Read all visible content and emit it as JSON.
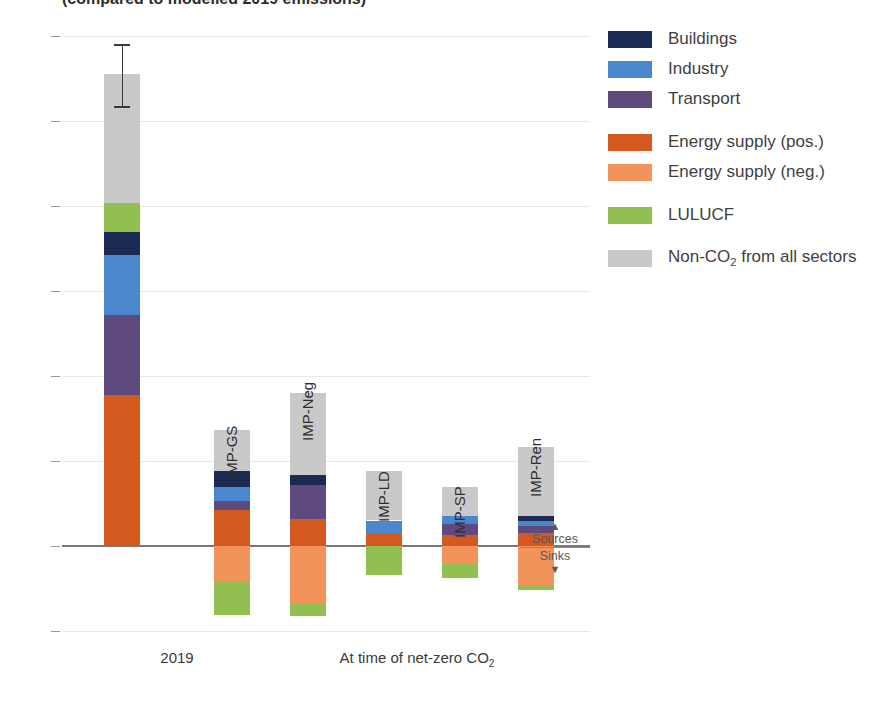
{
  "caption": "(compared to modelled 2019 emissions)",
  "axes": {
    "ylabel_text": "GtCO",
    "ylabel_sub": "2",
    "ylabel_rest": "-eq yr",
    "ylabel_sup": "-1",
    "yticks": [
      60,
      50,
      40,
      30,
      20,
      10,
      0,
      -10
    ],
    "ytick_labels": [
      "60",
      "50",
      "40",
      "30",
      "20",
      "10",
      "0",
      "–10"
    ],
    "ymin": -10,
    "ymax": 60,
    "xcats": [
      {
        "label": "2019",
        "sub": "",
        "left": 60,
        "width": 110
      },
      {
        "label": "At time of net-zero CO",
        "sub": "2",
        "left": 190,
        "width": 330
      }
    ]
  },
  "annotation": {
    "sources": "Sources",
    "sinks": "Sinks",
    "up_arrow": "▲",
    "down_arrow": "▼"
  },
  "colors": {
    "buildings": "#1b2a52",
    "industry": "#4b87cf",
    "transport": "#5e4a7d",
    "energy_pos": "#d4591e",
    "energy_neg": "#f0945c",
    "lulucf": "#92c050",
    "nonco2": "#c9c9c9",
    "grid": "#e8e8e8",
    "zero": "#7a7a7a",
    "text": "#3f3f3f"
  },
  "legend": {
    "position": "right",
    "items": [
      {
        "key": "buildings",
        "label": "Buildings",
        "sub": "",
        "color": "#1b2a52",
        "gap_after": false
      },
      {
        "key": "industry",
        "label": "Industry",
        "sub": "",
        "color": "#4b87cf",
        "gap_after": false
      },
      {
        "key": "transport",
        "label": "Transport",
        "sub": "",
        "color": "#5e4a7d",
        "gap_after": true
      },
      {
        "key": "energy_pos",
        "label": "Energy supply (pos.)",
        "sub": "",
        "color": "#d4591e",
        "gap_after": false
      },
      {
        "key": "energy_neg",
        "label": "Energy supply (neg.)",
        "sub": "",
        "color": "#f0945c",
        "gap_after": true
      },
      {
        "key": "lulucf",
        "label": "LULUCF",
        "sub": "",
        "color": "#92c050",
        "gap_after": true
      },
      {
        "key": "nonco2",
        "label": "Non-CO",
        "sub": "2",
        "label2": " from all sectors",
        "color": "#c9c9c9",
        "gap_after": false
      }
    ]
  },
  "chart_data": {
    "type": "bar",
    "subtype": "stacked-diverging",
    "title": "(compared to modelled 2019 emissions)",
    "xlabel": "",
    "ylabel": "GtCO2-eq yr-1",
    "ylim": [
      -10,
      60
    ],
    "grid": true,
    "legend_position": "right",
    "categories": [
      "2019",
      "IMP-GS",
      "IMP-Neg",
      "IMP-LD",
      "IMP-SP",
      "IMP-Ren"
    ],
    "series": [
      {
        "name": "Energy supply (pos.)",
        "color": "#d4591e",
        "values": [
          17.8,
          4.2,
          3.2,
          1.5,
          1.3,
          1.5
        ]
      },
      {
        "name": "Transport",
        "color": "#5e4a7d",
        "values": [
          7.3,
          1.1,
          4.0,
          0.0,
          1.3,
          0.9
        ]
      },
      {
        "name": "Industry",
        "color": "#4b87cf",
        "values": [
          7.0,
          1.6,
          0.0,
          1.5,
          0.9,
          0.5
        ]
      },
      {
        "name": "Buildings",
        "color": "#1b2a52",
        "values": [
          2.7,
          1.9,
          1.2,
          0.0,
          0.0,
          0.6
        ]
      },
      {
        "name": "LULUCF (pos.)",
        "color": "#92c050",
        "values": [
          3.4,
          0.0,
          0.0,
          0.0,
          0.0,
          0.0
        ]
      },
      {
        "name": "Non-CO2 from all sectors",
        "color": "#c9c9c9",
        "values": [
          15.3,
          4.9,
          9.6,
          5.8,
          3.5,
          8.2
        ]
      },
      {
        "name": "Energy supply (neg.)",
        "color": "#f0945c",
        "values": [
          0,
          -4.2,
          -6.7,
          0.0,
          -2.0,
          -4.6
        ]
      },
      {
        "name": "LULUCF (neg.)",
        "color": "#92c050",
        "values": [
          0,
          -3.9,
          -1.5,
          -3.4,
          -1.8,
          -0.6
        ]
      }
    ],
    "totals_positive": [
      55.0,
      13.7,
      18.0,
      8.8,
      7.0,
      11.7
    ],
    "totals_negative": [
      0,
      -8.1,
      -8.2,
      -3.4,
      -3.8,
      -5.2
    ],
    "error_bar": {
      "category": "2019",
      "value": 55.0,
      "low": 51.8,
      "high": 59.1
    }
  },
  "bars": [
    {
      "name": "2019",
      "label": "",
      "left": 42,
      "width": 36,
      "error": {
        "low": 51.8,
        "high": 59.1
      },
      "pos": [
        {
          "key": "energy_pos",
          "color": "#d4591e",
          "from": 0.0,
          "to": 17.8
        },
        {
          "key": "transport",
          "color": "#5e4a7d",
          "from": 17.8,
          "to": 27.2
        },
        {
          "key": "industry",
          "color": "#4b87cf",
          "from": 27.2,
          "to": 34.2
        },
        {
          "key": "buildings",
          "color": "#1b2a52",
          "from": 34.2,
          "to": 36.9
        },
        {
          "key": "lulucf",
          "color": "#92c050",
          "from": 36.9,
          "to": 40.3
        },
        {
          "key": "nonco2",
          "color": "#c9c9c9",
          "from": 40.3,
          "to": 55.5
        }
      ],
      "neg": []
    },
    {
      "name": "IMP-GS",
      "label": "IMP-GS",
      "left": 152,
      "width": 36,
      "error": null,
      "pos": [
        {
          "key": "energy_pos",
          "color": "#d4591e",
          "from": 0.0,
          "to": 4.2
        },
        {
          "key": "transport",
          "color": "#5e4a7d",
          "from": 4.2,
          "to": 5.3
        },
        {
          "key": "industry",
          "color": "#4b87cf",
          "from": 5.3,
          "to": 6.9
        },
        {
          "key": "buildings",
          "color": "#1b2a52",
          "from": 6.9,
          "to": 8.8
        },
        {
          "key": "nonco2",
          "color": "#c9c9c9",
          "from": 8.8,
          "to": 13.7
        }
      ],
      "neg": [
        {
          "key": "energy_neg",
          "color": "#f0945c",
          "from": 0.0,
          "to": -4.2
        },
        {
          "key": "lulucf",
          "color": "#92c050",
          "from": -4.2,
          "to": -8.1
        }
      ]
    },
    {
      "name": "IMP-Neg",
      "label": "IMP-Neg",
      "left": 228,
      "width": 36,
      "error": null,
      "pos": [
        {
          "key": "energy_pos",
          "color": "#d4591e",
          "from": 0.0,
          "to": 3.2
        },
        {
          "key": "transport",
          "color": "#5e4a7d",
          "from": 3.2,
          "to": 7.2
        },
        {
          "key": "buildings",
          "color": "#1b2a52",
          "from": 7.2,
          "to": 8.4
        },
        {
          "key": "nonco2",
          "color": "#c9c9c9",
          "from": 8.4,
          "to": 18.0
        }
      ],
      "neg": [
        {
          "key": "energy_neg",
          "color": "#f0945c",
          "from": 0.0,
          "to": -6.7
        },
        {
          "key": "lulucf",
          "color": "#92c050",
          "from": -6.7,
          "to": -8.2
        }
      ]
    },
    {
      "name": "IMP-LD",
      "label": "IMP-LD",
      "left": 304,
      "width": 36,
      "error": null,
      "pos": [
        {
          "key": "energy_pos",
          "color": "#d4591e",
          "from": 0.0,
          "to": 1.5
        },
        {
          "key": "industry",
          "color": "#4b87cf",
          "from": 1.5,
          "to": 3.0
        },
        {
          "key": "nonco2",
          "color": "#c9c9c9",
          "from": 3.0,
          "to": 8.8
        }
      ],
      "neg": [
        {
          "key": "lulucf",
          "color": "#92c050",
          "from": 0.0,
          "to": -3.4
        }
      ]
    },
    {
      "name": "IMP-SP",
      "label": "IMP-SP",
      "left": 380,
      "width": 36,
      "error": null,
      "pos": [
        {
          "key": "energy_pos",
          "color": "#d4591e",
          "from": 0.0,
          "to": 1.3
        },
        {
          "key": "transport",
          "color": "#5e4a7d",
          "from": 1.3,
          "to": 2.6
        },
        {
          "key": "industry",
          "color": "#4b87cf",
          "from": 2.6,
          "to": 3.5
        },
        {
          "key": "nonco2",
          "color": "#c9c9c9",
          "from": 3.5,
          "to": 7.0
        }
      ],
      "neg": [
        {
          "key": "energy_neg",
          "color": "#f0945c",
          "from": 0.0,
          "to": -2.0
        },
        {
          "key": "lulucf",
          "color": "#92c050",
          "from": -2.0,
          "to": -3.8
        }
      ]
    },
    {
      "name": "IMP-Ren",
      "label": "IMP-Ren",
      "left": 456,
      "width": 36,
      "error": null,
      "pos": [
        {
          "key": "energy_pos",
          "color": "#d4591e",
          "from": 0.0,
          "to": 1.5
        },
        {
          "key": "transport",
          "color": "#5e4a7d",
          "from": 1.5,
          "to": 2.4
        },
        {
          "key": "industry",
          "color": "#4b87cf",
          "from": 2.4,
          "to": 2.9
        },
        {
          "key": "buildings",
          "color": "#1b2a52",
          "from": 2.9,
          "to": 3.5
        },
        {
          "key": "nonco2",
          "color": "#c9c9c9",
          "from": 3.5,
          "to": 11.7
        }
      ],
      "neg": [
        {
          "key": "energy_neg",
          "color": "#f0945c",
          "from": 0.0,
          "to": -4.6
        },
        {
          "key": "lulucf",
          "color": "#92c050",
          "from": -4.6,
          "to": -5.2
        }
      ]
    }
  ],
  "bar_label_tops": {
    "2019": 0,
    "IMP-GS": 436,
    "IMP-Neg": 398,
    "IMP-LD": 479,
    "IMP-SP": 495,
    "IMP-Ren": 454
  }
}
